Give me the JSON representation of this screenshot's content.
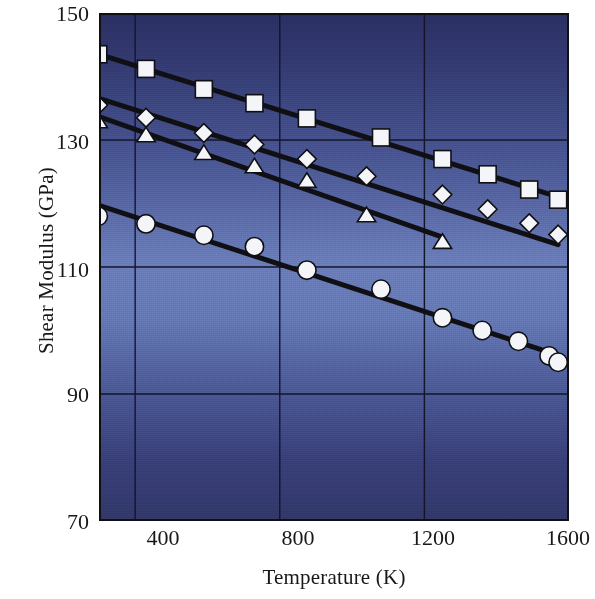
{
  "chart_data": {
    "type": "scatter",
    "title": "",
    "xlabel": "Temperature (K)",
    "ylabel": "Shear Modulus (GPa)",
    "xlim": [
      300,
      1600
    ],
    "ylim": [
      70,
      150
    ],
    "xticks": [
      400,
      800,
      1200,
      1600
    ],
    "yticks": [
      70,
      90,
      110,
      130,
      150
    ],
    "grid": true,
    "legend": "none",
    "marker_face_color": "#f4f5f8",
    "marker_edge_color": "#101014",
    "line_color": "#101014",
    "plot_bg_top": "#2a2f60",
    "plot_bg_mid": "#6a7cbb",
    "plot_bg_bottom": "#313866",
    "series": [
      {
        "name": "squares",
        "marker": "square",
        "x": [
          298,
          430,
          590,
          730,
          875,
          1080,
          1250,
          1375,
          1490,
          1570
        ],
        "y": [
          143.5,
          141.2,
          138.0,
          135.8,
          133.4,
          130.4,
          127.0,
          124.6,
          122.2,
          120.6
        ]
      },
      {
        "name": "diamonds",
        "marker": "diamond",
        "x": [
          298,
          430,
          590,
          730,
          875,
          1040,
          1250,
          1375,
          1490,
          1570
        ],
        "y": [
          135.5,
          133.5,
          131.1,
          129.3,
          127.0,
          124.3,
          121.4,
          119.1,
          116.9,
          115.1
        ],
        "y_right": [
          135.5,
          133.5,
          131.1,
          129.3,
          127.0,
          124.3,
          121.4,
          117.6,
          114.0,
          111.3
        ]
      },
      {
        "name": "triangles",
        "marker": "triangle",
        "x": [
          298,
          430,
          590,
          730,
          875,
          1040,
          1250
        ],
        "y": [
          133.0,
          130.8,
          128.0,
          125.9,
          123.6,
          118.2,
          114.0
        ]
      },
      {
        "name": "circles",
        "marker": "circle",
        "x": [
          298,
          430,
          590,
          730,
          875,
          1080,
          1250,
          1360,
          1460,
          1545,
          1570
        ],
        "y": [
          118.0,
          116.8,
          115.0,
          113.2,
          109.5,
          106.5,
          102.0,
          100.0,
          98.3,
          96.0,
          95.0
        ]
      }
    ]
  },
  "axes": {
    "ylabel_text": "Shear Modulus (GPa)",
    "xlabel_text": "Temperature (K)",
    "yticks": [
      {
        "value": "150"
      },
      {
        "value": "130"
      },
      {
        "value": "110"
      },
      {
        "value": "90"
      },
      {
        "value": "70"
      }
    ],
    "xticks": [
      {
        "value": "400"
      },
      {
        "value": "800"
      },
      {
        "value": "1200"
      },
      {
        "value": "1600"
      }
    ]
  }
}
